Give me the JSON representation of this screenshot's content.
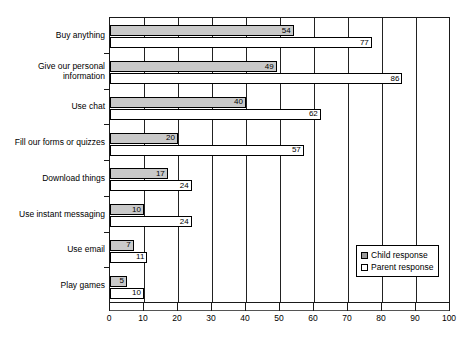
{
  "chart_data": {
    "type": "bar",
    "orientation": "horizontal",
    "title": "",
    "xlabel": "",
    "ylabel": "",
    "xlim": [
      0,
      100
    ],
    "xticks": [
      0,
      10,
      20,
      30,
      40,
      50,
      60,
      70,
      80,
      90,
      100
    ],
    "grid": true,
    "grid_axis": "x",
    "legend_position": "lower-right",
    "categories": [
      "Buy anything",
      "Give our personal\ninformation",
      "Use chat",
      "Fill our forms or quizzes",
      "Download things",
      "Use instant messaging",
      "Use email",
      "Play games"
    ],
    "series": [
      {
        "name": "Child response",
        "color": "#c9c9c9",
        "values": [
          54,
          49,
          40,
          20,
          17,
          10,
          7,
          5
        ]
      },
      {
        "name": "Parent response",
        "color": "#ffffff",
        "values": [
          77,
          86,
          62,
          57,
          24,
          24,
          11,
          10
        ]
      }
    ]
  },
  "legend": {
    "items": [
      {
        "label": "Child response",
        "swatch": "child"
      },
      {
        "label": "Parent response",
        "swatch": "parent"
      }
    ]
  },
  "colors": {
    "child_fill": "#c9c9c9",
    "parent_fill": "#ffffff",
    "axis": "#1a1a1a",
    "background": "#ffffff"
  }
}
